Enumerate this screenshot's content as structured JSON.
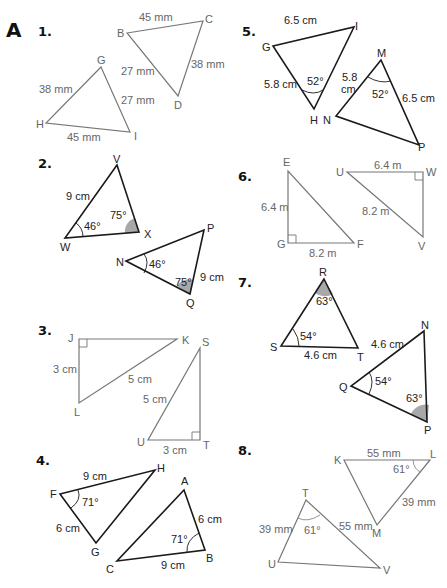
{
  "section_label": "A",
  "problems": {
    "p1": {
      "number": "1.",
      "tri1": {
        "vertices": [
          "B",
          "C",
          "D"
        ],
        "sides": {
          "BC": "45 mm",
          "CD": "38 mm",
          "BD": "27 mm"
        }
      },
      "tri2": {
        "vertices": [
          "G",
          "H",
          "I"
        ],
        "sides": {
          "GH": "38 mm",
          "GI": "27 mm",
          "HI": "45 mm"
        }
      }
    },
    "p2": {
      "number": "2.",
      "tri1": {
        "vertices": [
          "V",
          "W",
          "X"
        ],
        "sides": {
          "VW": "9 cm"
        },
        "angles": {
          "W": "46°",
          "X": "75°"
        }
      },
      "tri2": {
        "vertices": [
          "N",
          "P",
          "Q"
        ],
        "sides": {
          "PQ": "9 cm"
        },
        "angles": {
          "N": "46°",
          "Q": "75°"
        }
      }
    },
    "p3": {
      "number": "3.",
      "tri1": {
        "vertices": [
          "J",
          "K",
          "L"
        ],
        "sides": {
          "JL": "3 cm",
          "KL": "5 cm"
        }
      },
      "tri2": {
        "vertices": [
          "S",
          "T",
          "U"
        ],
        "sides": {
          "SU": "5 cm",
          "UT": "3 cm"
        }
      }
    },
    "p4": {
      "number": "4.",
      "tri1": {
        "vertices": [
          "F",
          "G",
          "H"
        ],
        "sides": {
          "FH": "9 cm",
          "FG": "6 cm"
        },
        "angles": {
          "F": "71°"
        }
      },
      "tri2": {
        "vertices": [
          "A",
          "B",
          "C"
        ],
        "sides": {
          "AB": "6 cm",
          "BC": "9 cm"
        },
        "angles": {
          "B": "71°"
        }
      }
    },
    "p5": {
      "number": "5.",
      "tri1": {
        "vertices": [
          "G",
          "H",
          "I"
        ],
        "sides": {
          "GI": "6.5 cm",
          "GH": "5.8 cm"
        },
        "angles": {
          "H": "52°"
        }
      },
      "tri2": {
        "vertices": [
          "M",
          "N",
          "P"
        ],
        "sides": {
          "MN_line1": "5.8",
          "MN_line2": "cm",
          "MP": "6.5 cm"
        },
        "angles": {
          "M": "52°"
        }
      }
    },
    "p6": {
      "number": "6.",
      "tri1": {
        "vertices": [
          "E",
          "F",
          "G"
        ],
        "sides": {
          "EG": "6.4 m",
          "GF": "8.2 m"
        }
      },
      "tri2": {
        "vertices": [
          "U",
          "V",
          "W"
        ],
        "sides": {
          "UW": "6.4 m",
          "UV": "8.2 m"
        }
      }
    },
    "p7": {
      "number": "7.",
      "tri1": {
        "vertices": [
          "R",
          "S",
          "T"
        ],
        "sides": {
          "ST": "4.6 cm"
        },
        "angles": {
          "R": "63°",
          "S": "54°"
        }
      },
      "tri2": {
        "vertices": [
          "N",
          "P",
          "Q"
        ],
        "sides": {
          "QN": "4.6 cm"
        },
        "angles": {
          "Q": "54°",
          "P": "63°"
        }
      }
    },
    "p8": {
      "number": "8.",
      "tri1": {
        "vertices": [
          "K",
          "L",
          "M"
        ],
        "sides": {
          "KL": "55 mm",
          "LM": "39 mm"
        },
        "angles": {
          "L": "61°"
        }
      },
      "tri2": {
        "vertices": [
          "T",
          "U",
          "V"
        ],
        "sides": {
          "TU": "39 mm",
          "TV": "55 mm"
        },
        "angles": {
          "T": "61°"
        }
      }
    }
  },
  "colors": {
    "dark_line": "#1a1a1a",
    "grey_line": "#777777",
    "shade": "#a8a8a8"
  }
}
